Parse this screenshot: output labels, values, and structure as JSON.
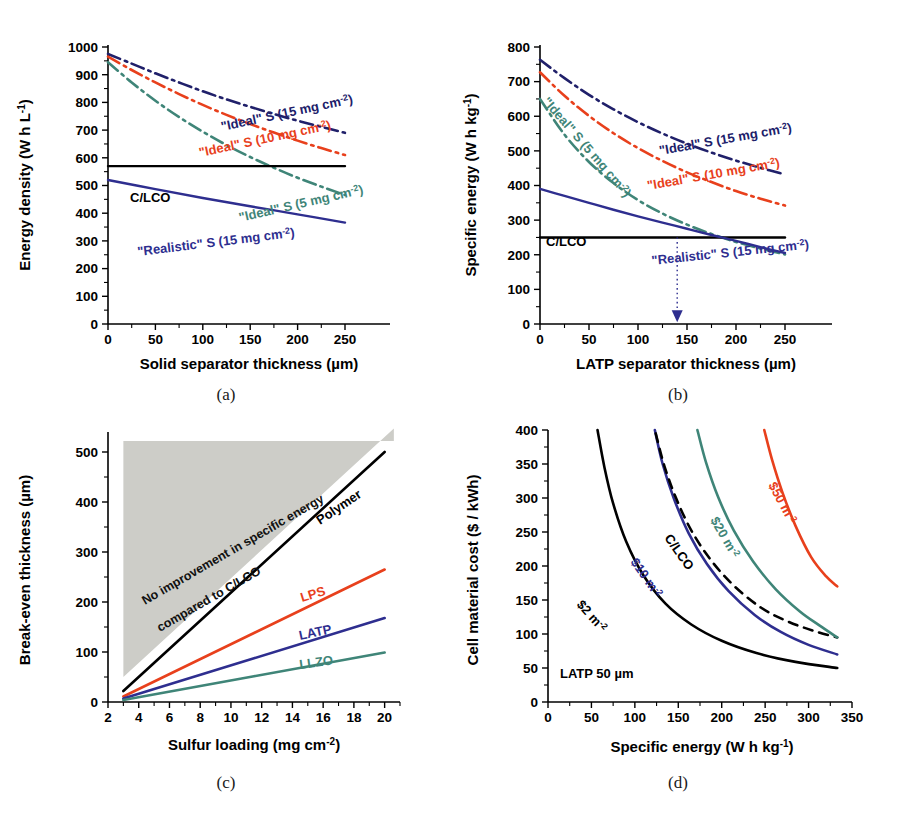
{
  "figure": {
    "background": "#ffffff",
    "captions": [
      "(a)",
      "(b)",
      "(c)",
      "(d)"
    ]
  },
  "colors": {
    "navy": "#20206a",
    "red": "#e8401c",
    "teal": "#3f8578",
    "black": "#000000",
    "blue_solid": "#2e2e8f",
    "shade_gray": "#cdcdc8"
  },
  "chart_data": [
    {
      "id": "panel-a",
      "type": "line",
      "title": "",
      "caption": "(a)",
      "xlabel": "Solid separator thickness (µm)",
      "ylabel": "Energy density (W h L",
      "ylabel_sup": "-1",
      "ylabel_tail": ")",
      "xlim": [
        0,
        260
      ],
      "ylim": [
        0,
        1000
      ],
      "xticks": [
        0,
        50,
        100,
        150,
        200,
        250
      ],
      "yticks": [
        0,
        100,
        200,
        300,
        400,
        500,
        600,
        700,
        800,
        900,
        1000
      ],
      "grid": false,
      "legend": "inline-curve-labels",
      "series": [
        {
          "name": "\"Ideal\" S (15 mg cm-2)",
          "label_main": "\"Ideal\" S (15 mg cm",
          "label_sup": "-2",
          "label_tail": ")",
          "color": "#20206a",
          "style": "dash-dot",
          "x": [
            0,
            25,
            50,
            75,
            100,
            125,
            150,
            175,
            200,
            225,
            250
          ],
          "y": [
            975,
            940,
            905,
            872,
            840,
            811,
            784,
            758,
            734,
            712,
            690
          ]
        },
        {
          "name": "\"Ideal\" S (10 mg cm-2)",
          "label_main": "\"Ideal\" S (10 mg cm",
          "label_sup": "-2",
          "label_tail": ")",
          "color": "#e8401c",
          "style": "dash-dot",
          "x": [
            0,
            25,
            50,
            75,
            100,
            125,
            150,
            175,
            200,
            225,
            250
          ],
          "y": [
            965,
            917,
            872,
            830,
            791,
            755,
            722,
            691,
            662,
            635,
            610
          ]
        },
        {
          "name": "\"Ideal\" S (5 mg cm-2)",
          "label_main": "\"Ideal\" S (5 mg cm",
          "label_sup": "-2",
          "label_tail": ")",
          "color": "#3f8578",
          "style": "dash-dot",
          "x": [
            0,
            25,
            50,
            75,
            100,
            125,
            150,
            175,
            200,
            225,
            250
          ],
          "y": [
            945,
            872,
            806,
            747,
            694,
            646,
            603,
            564,
            528,
            496,
            466
          ]
        },
        {
          "name": "C/LCO",
          "label_main": "C/LCO",
          "label_sup": "",
          "label_tail": "",
          "color": "#000000",
          "style": "solid",
          "x": [
            0,
            250
          ],
          "y": [
            570,
            570
          ]
        },
        {
          "name": "\"Realistic\" S (15 mg cm-2)",
          "label_main": "\"Realistic\" S (15 mg cm",
          "label_sup": "-2",
          "label_tail": ")",
          "color": "#2e2e8f",
          "style": "solid",
          "x": [
            0,
            50,
            100,
            150,
            200,
            250
          ],
          "y": [
            520,
            487,
            455,
            425,
            396,
            366
          ]
        }
      ]
    },
    {
      "id": "panel-b",
      "type": "line",
      "title": "",
      "caption": "(b)",
      "xlabel": "LATP separator thickness (µm)",
      "ylabel": "Specific energy (W h kg",
      "ylabel_sup": "-1",
      "ylabel_tail": ")",
      "xlim": [
        0,
        260
      ],
      "ylim": [
        0,
        800
      ],
      "xticks": [
        0,
        50,
        100,
        150,
        200,
        250
      ],
      "yticks": [
        0,
        100,
        200,
        300,
        400,
        500,
        600,
        700,
        800
      ],
      "grid": false,
      "annotation": {
        "arrow_x": 140,
        "arrow_style": "dotted-down-arrow",
        "color": "#2e2e8f"
      },
      "series": [
        {
          "name": "\"Ideal\" S (15 mg cm-2)",
          "label_main": "\"Ideal\" S (15 mg cm",
          "label_sup": "-2",
          "label_tail": ")",
          "color": "#20206a",
          "style": "dash-dot",
          "x": [
            0,
            25,
            50,
            75,
            100,
            125,
            150,
            175,
            200,
            225,
            250
          ],
          "y": [
            763,
            710,
            662,
            620,
            583,
            550,
            521,
            495,
            472,
            451,
            432
          ]
        },
        {
          "name": "\"Ideal\" S (10 mg cm-2)",
          "label_main": "\"Ideal\" S (10 mg cm",
          "label_sup": "-2",
          "label_tail": ")",
          "color": "#e8401c",
          "style": "dash-dot",
          "x": [
            0,
            25,
            50,
            75,
            100,
            125,
            150,
            175,
            200,
            225,
            250
          ],
          "y": [
            727,
            659,
            601,
            551,
            508,
            471,
            438,
            410,
            384,
            362,
            342
          ]
        },
        {
          "name": "\"Ideal\" S (5 mg cm-2)",
          "label_main": "\"Ideal\" S (5 mg cm",
          "label_sup": "-2",
          "label_tail": ")",
          "color": "#3f8578",
          "style": "dash-dot",
          "x": [
            0,
            25,
            50,
            75,
            100,
            125,
            150,
            175,
            200,
            225,
            250
          ],
          "y": [
            650,
            547,
            468,
            407,
            358,
            319,
            287,
            260,
            237,
            218,
            201
          ]
        },
        {
          "name": "C/LCO",
          "label_main": "C/LCO",
          "label_sup": "",
          "label_tail": "",
          "color": "#000000",
          "style": "solid",
          "x": [
            0,
            250
          ],
          "y": [
            250,
            250
          ]
        },
        {
          "name": "\"Realistic\" S (15 mg cm-2)",
          "label_main": "\"Realistic\" S (15 mg cm",
          "label_sup": "-2",
          "label_tail": ")",
          "color": "#2e2e8f",
          "style": "solid",
          "x": [
            0,
            25,
            50,
            75,
            100,
            125,
            150,
            175,
            200,
            225,
            250
          ],
          "y": [
            390,
            370,
            350,
            330,
            311,
            293,
            275,
            257,
            240,
            222,
            205
          ]
        }
      ]
    },
    {
      "id": "panel-c",
      "type": "line",
      "caption": "(c)",
      "xlabel": "Sulfur loading (mg cm",
      "xlabel_sup": "-2",
      "xlabel_tail": ")",
      "ylabel": "Break-even thickness (µm)",
      "xlim": [
        2,
        21
      ],
      "ylim": [
        0,
        540
      ],
      "xticks": [
        2,
        4,
        6,
        8,
        10,
        12,
        14,
        16,
        18,
        20
      ],
      "yticks": [
        0,
        100,
        200,
        300,
        400,
        500
      ],
      "grid": false,
      "shaded_region": {
        "label_line1": "No improvement in specific energy",
        "label_line2": "compared to C/LCO",
        "color": "#cdcdc8"
      },
      "series": [
        {
          "name": "Polymer",
          "label_main": "Polymer",
          "color": "#000000",
          "style": "solid",
          "x": [
            3,
            20
          ],
          "y": [
            22,
            500
          ]
        },
        {
          "name": "LPS",
          "label_main": "LPS",
          "color": "#e8401c",
          "style": "solid",
          "x": [
            3,
            20
          ],
          "y": [
            11,
            265
          ]
        },
        {
          "name": "LATP",
          "label_main": "LATP",
          "color": "#2e2e8f",
          "style": "solid",
          "x": [
            3,
            20
          ],
          "y": [
            7,
            168
          ]
        },
        {
          "name": "LLZO",
          "label_main": "LLZO",
          "color": "#3f8578",
          "style": "solid",
          "x": [
            3,
            20
          ],
          "y": [
            4,
            99
          ]
        }
      ]
    },
    {
      "id": "panel-d",
      "type": "line",
      "caption": "(d)",
      "xlabel": "Specific energy (W h kg",
      "xlabel_sup": "-1",
      "xlabel_tail": ")",
      "ylabel": "Cell material cost ($ / kWh)",
      "xlim": [
        0,
        350
      ],
      "ylim": [
        0,
        400
      ],
      "xticks": [
        0,
        50,
        100,
        150,
        200,
        250,
        300,
        350
      ],
      "yticks": [
        0,
        50,
        100,
        150,
        200,
        250,
        300,
        350,
        400
      ],
      "grid": false,
      "note": "LATP 50 µm",
      "series": [
        {
          "name": "$2 m-2",
          "label_main": "$2 m",
          "label_sup": "-2",
          "label_tail": "",
          "color": "#000000",
          "style": "solid",
          "x": [
            57,
            65,
            75,
            90,
            110,
            135,
            165,
            200,
            240,
            285,
            333
          ],
          "y": [
            400,
            345,
            292,
            236,
            186,
            145,
            114,
            90,
            72,
            59,
            50
          ]
        },
        {
          "name": "$10 m-2",
          "label_main": "$10 m",
          "label_sup": "-2",
          "label_tail": "",
          "color": "#2e2e8f",
          "style": "solid",
          "x": [
            123,
            132,
            145,
            162,
            183,
            208,
            238,
            268,
            300,
            333
          ],
          "y": [
            400,
            350,
            299,
            248,
            203,
            163,
            128,
            103,
            84,
            70
          ]
        },
        {
          "name": "C/LCO",
          "label_main": "C/LCO",
          "label_sup": "",
          "label_tail": "",
          "color": "#000000",
          "style": "dashed",
          "x": [
            124,
            134,
            148,
            166,
            188,
            214,
            245,
            275,
            305,
            333
          ],
          "y": [
            395,
            347,
            298,
            250,
            208,
            171,
            139,
            119,
            105,
            95
          ]
        },
        {
          "name": "$20 m-2",
          "label_main": "$20 m",
          "label_sup": "-2",
          "label_tail": "",
          "color": "#3f8578",
          "style": "solid",
          "x": [
            172,
            182,
            196,
            214,
            236,
            262,
            290,
            312,
            333
          ],
          "y": [
            400,
            352,
            301,
            252,
            207,
            166,
            133,
            113,
            95
          ]
        },
        {
          "name": "$50 m-2",
          "label_main": "$50 m",
          "label_sup": "-2",
          "label_tail": "",
          "color": "#e8401c",
          "style": "solid",
          "x": [
            249,
            258,
            270,
            285,
            303,
            320,
            333
          ],
          "y": [
            400,
            356,
            308,
            259,
            213,
            185,
            170
          ]
        }
      ]
    }
  ]
}
